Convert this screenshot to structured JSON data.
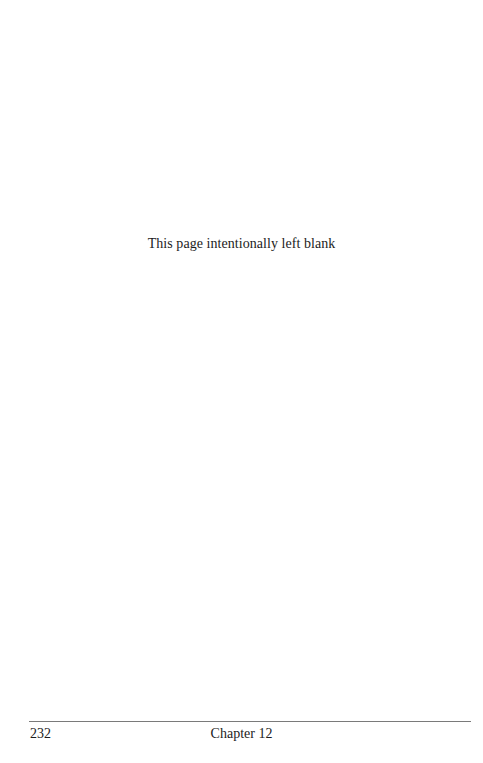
{
  "page": {
    "body_text": "This page intentionally left blank",
    "footer": {
      "page_number": "232",
      "running_title": "Chapter 12"
    }
  },
  "colors": {
    "background": "#ffffff",
    "text": "#1c1c1c",
    "rule": "#7a7a7a"
  }
}
